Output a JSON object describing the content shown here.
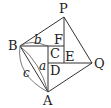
{
  "diagram": {
    "points": {
      "P": {
        "label": "P",
        "x": 64,
        "y": 17
      },
      "B": {
        "label": "B",
        "x": 20,
        "y": 46
      },
      "F": {
        "label": "F",
        "x": 64,
        "y": 46
      },
      "C": {
        "label": "C",
        "x": 48,
        "y": 46
      },
      "E": {
        "label": "E",
        "x": 64,
        "y": 63
      },
      "D": {
        "label": "D",
        "x": 48,
        "y": 63
      },
      "Q": {
        "label": "Q",
        "x": 92,
        "y": 63
      },
      "A": {
        "label": "A",
        "x": 48,
        "y": 92
      }
    },
    "side_labels": {
      "a": "a",
      "b": "b",
      "c": "c"
    }
  }
}
